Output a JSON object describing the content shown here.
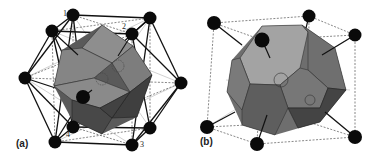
{
  "figure": {
    "panels": [
      {
        "id": "a",
        "label": "(a)",
        "description": "Rhombic dodecahedron (grey polyhedron) surrounded by 12 black spheres forming a cuboctahedral cage with solid and dashed bond lines",
        "vertex_labels": [
          "1",
          "2",
          "3",
          "4"
        ]
      },
      {
        "id": "b",
        "label": "(b)",
        "description": "Truncated octahedron (grey polyhedron) inside a dashed cube with black spheres at cube corners connected by bond lines"
      }
    ],
    "colors": {
      "sphere": "#0a0a0a",
      "face_light": "#9a9a9a",
      "face_mid": "#7a7a7a",
      "face_dark": "#4a4a4a",
      "line": "#111111",
      "dashed": "#555555"
    }
  }
}
